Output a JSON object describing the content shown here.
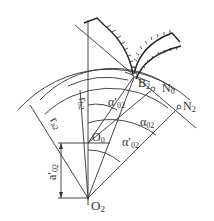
{
  "diagram": {
    "points": {
      "O2": {
        "label": "O",
        "sub": "2",
        "x": 88,
        "y": 198
      },
      "O0": {
        "label": "O",
        "sub": "0",
        "x": 88,
        "y": 143
      },
      "B2": {
        "label": "B",
        "sub": "2",
        "x": 135,
        "y": 75
      },
      "N0": {
        "label": "N",
        "sub": "0",
        "x": 153,
        "y": 89
      },
      "N2": {
        "label": "N",
        "sub": "2",
        "x": 179,
        "y": 107
      }
    },
    "labels": {
      "ra2": {
        "main": "r",
        "sub": "a2"
      },
      "rb2": {
        "main": "r",
        "sub": "b2"
      },
      "a02_prime": {
        "main": "a′",
        "sub": "02"
      },
      "alpha02": {
        "main": "α",
        "sub": "02"
      },
      "alpha02_prime_upper": {
        "main": "α′",
        "sub": "02"
      },
      "alpha02_prime_lower": {
        "main": "α′",
        "sub": "02"
      }
    }
  }
}
